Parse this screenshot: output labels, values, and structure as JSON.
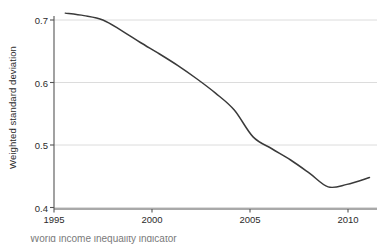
{
  "chart_data": {
    "type": "line",
    "title": "",
    "subtitle": "",
    "xlabel": "",
    "ylabel": "Weighted standard deviation",
    "xlim": [
      1994.4,
      2011.6
    ],
    "ylim": [
      0.4,
      0.715
    ],
    "xticks": [
      1995,
      2000,
      2005,
      2010
    ],
    "xtick_labels": [
      "1995",
      "2000",
      "2005",
      "2010"
    ],
    "yticks": [
      0.4,
      0.5,
      0.6,
      0.7
    ],
    "ytick_labels": [
      "0.4",
      "0.5",
      "0.6",
      "0.7"
    ],
    "grid": "horizontal",
    "legend": "none",
    "annotations": [],
    "series": [
      {
        "name": "Weighted standard deviation",
        "color": "#3a3a3a",
        "x": [
          1995,
          1996,
          1997,
          1998,
          1999,
          2000,
          2001,
          2002,
          2003,
          2004,
          2005,
          2006,
          2007,
          2008,
          2009,
          2010,
          2011.2
        ],
        "values": [
          0.711,
          0.707,
          0.7,
          0.683,
          0.664,
          0.646,
          0.627,
          0.606,
          0.583,
          0.556,
          0.513,
          0.494,
          0.476,
          0.455,
          0.433,
          0.437,
          0.448
        ]
      }
    ]
  },
  "axes": {
    "y_axis_title": "Weighted standard deviation",
    "axis_color": "#4a4a4a",
    "grid_color": "#dcdcdc",
    "tick_text_color": "#2b2b2b"
  },
  "caption": {
    "cropped_text": "World  income  inequality  indicator"
  }
}
